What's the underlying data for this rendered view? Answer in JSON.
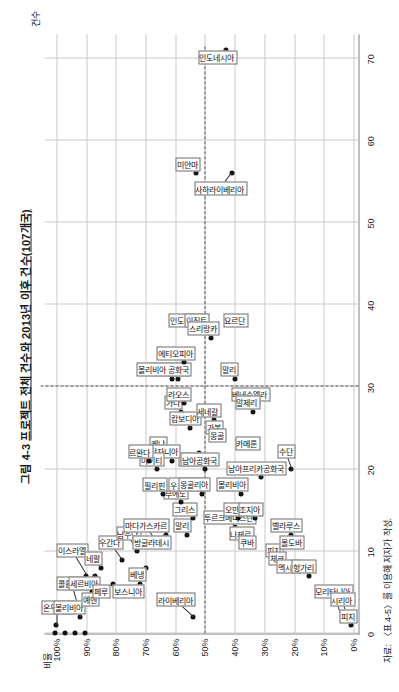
{
  "figure": {
    "title_prefix": "그림 4-3",
    "title_main": "프로젝트 전체 건수와 2013년 이후 건수(107개국)",
    "source_note": "자료: 〈표 4-5〉를 이용해 저자가 작성."
  },
  "axes": {
    "x_title": "건수",
    "y_title": "비율",
    "x_ticks": [
      "0",
      "10",
      "20",
      "30",
      "40",
      "50",
      "60",
      "70"
    ],
    "x_values": [
      0,
      10,
      20,
      30,
      40,
      50,
      60,
      70
    ],
    "x_min": 0,
    "x_max": 73,
    "y_ticks": [
      "0%",
      "10%",
      "20%",
      "30%",
      "40%",
      "50%",
      "60%",
      "70%",
      "80%",
      "90%",
      "100%"
    ],
    "y_values": [
      0,
      10,
      20,
      30,
      40,
      50,
      60,
      70,
      80,
      90,
      100
    ],
    "y_min": -2,
    "y_max": 104,
    "reference_x": 30,
    "reference_y": 50,
    "grid": true
  },
  "chart_data": {
    "type": "scatter",
    "title": "그림 4-3 프로젝트 전체 건수와 2013년 이후 건수(107개국)",
    "xlabel": "건수",
    "ylabel": "비율",
    "xlim": [
      0,
      73
    ],
    "ylim": [
      -2,
      104
    ],
    "grid": true,
    "legend": "none",
    "reference_lines": {
      "vertical_x": 30,
      "horizontal_y": 50
    },
    "points": [
      {
        "label": "온두라스",
        "x": 1,
        "y": 100,
        "lx": 3,
        "ly": 100
      },
      {
        "label": "콜롬비아",
        "x": 2,
        "y": 92,
        "lx": 6,
        "ly": 95
      },
      {
        "label": "볼리비아",
        "x": 4,
        "y": 90,
        "lx": 3,
        "ly": 96
      },
      {
        "label": "이스라엘",
        "x": 7,
        "y": 90,
        "lx": 10,
        "ly": 95
      },
      {
        "label": "세르비아",
        "x": 7,
        "y": 87,
        "lx": 6,
        "ly": 91
      },
      {
        "label": "예멘",
        "x": 5,
        "y": 88,
        "lx": 4,
        "ly": 89
      },
      {
        "label": "네팔",
        "x": 8,
        "y": 85,
        "lx": 9,
        "ly": 88
      },
      {
        "label": "페루",
        "x": 6,
        "y": 81,
        "lx": 5,
        "ly": 85
      },
      {
        "label": "우간다",
        "x": 9,
        "y": 78,
        "lx": 11,
        "ly": 82
      },
      {
        "label": "보스니아",
        "x": 6,
        "y": 72,
        "lx": 5,
        "ly": 76
      },
      {
        "label": "남수단",
        "x": 10,
        "y": 73,
        "lx": 12,
        "ly": 76
      },
      {
        "label": "베냉",
        "x": 8,
        "y": 70,
        "lx": 7,
        "ly": 73
      },
      {
        "label": "마다가스카르",
        "x": 11,
        "y": 66,
        "lx": 13,
        "ly": 70
      },
      {
        "label": "방글라데시",
        "x": 12,
        "y": 63,
        "lx": 11,
        "ly": 68
      },
      {
        "label": "라이베리아",
        "x": 2,
        "y": 54,
        "lx": 4,
        "ly": 60
      },
      {
        "label": "말리",
        "x": 12,
        "y": 56,
        "lx": 13,
        "ly": 58
      },
      {
        "label": "그리스",
        "x": 14,
        "y": 54,
        "lx": 15,
        "ly": 57
      },
      {
        "label": "부에노",
        "x": 16,
        "y": 58,
        "lx": 17,
        "ly": 60
      },
      {
        "label": "우크라이나",
        "x": 18,
        "y": 53,
        "lx": 18,
        "ly": 56
      },
      {
        "label": "몽골리아",
        "x": 17,
        "y": 51,
        "lx": 18,
        "ly": 54
      },
      {
        "label": "베트남",
        "x": 22,
        "y": 52,
        "lx": 21,
        "ly": 55
      },
      {
        "label": "남아공화국",
        "x": 20,
        "y": 50,
        "lx": 21,
        "ly": 52
      },
      {
        "label": "가나",
        "x": 27,
        "y": 58,
        "lx": 28,
        "ly": 61
      },
      {
        "label": "케냐",
        "x": 22,
        "y": 63,
        "lx": 23,
        "ly": 66
      },
      {
        "label": "탄자니아",
        "x": 21,
        "y": 61,
        "lx": 22,
        "ly": 64
      },
      {
        "label": "아이티",
        "x": 20,
        "y": 66,
        "lx": 21,
        "ly": 68
      },
      {
        "label": "르완다",
        "x": 21,
        "y": 69,
        "lx": 22,
        "ly": 72
      },
      {
        "label": "필리핀",
        "x": 17,
        "y": 64,
        "lx": 18,
        "ly": 67
      },
      {
        "label": "캄보디아",
        "x": 25,
        "y": 55,
        "lx": 26,
        "ly": 57
      },
      {
        "label": "라오스",
        "x": 28,
        "y": 57,
        "lx": 29,
        "ly": 59
      },
      {
        "label": "나이지리아",
        "x": 31,
        "y": 59,
        "lx": 32,
        "ly": 62
      },
      {
        "label": "볼리비아 공화국",
        "x": 31,
        "y": 61,
        "lx": 32,
        "ly": 64
      },
      {
        "label": "에티오피아",
        "x": 33,
        "y": 57,
        "lx": 34,
        "ly": 60
      },
      {
        "label": "인도네시아",
        "x": 37,
        "y": 53,
        "lx": 38,
        "ly": 56
      },
      {
        "label": "이집트",
        "x": 38,
        "y": 51,
        "lx": 38,
        "ly": 53
      },
      {
        "label": "스리랑카",
        "x": 36,
        "y": 48,
        "lx": 37,
        "ly": 51
      },
      {
        "label": "미얀마",
        "x": 56,
        "y": 53,
        "lx": 57,
        "ly": 56
      },
      {
        "label": "인도네시아",
        "x": 71,
        "y": 43,
        "lx": 70,
        "ly": 46
      },
      {
        "label": "사하라이베리아",
        "x": 56,
        "y": 41,
        "lx": 54,
        "ly": 45
      },
      {
        "label": "요르단",
        "x": 38,
        "y": 38,
        "lx": 38,
        "ly": 40
      },
      {
        "label": "말리",
        "x": 31,
        "y": 40,
        "lx": 32,
        "ly": 42
      },
      {
        "label": "베네수엘라",
        "x": 28,
        "y": 32,
        "lx": 29,
        "ly": 35
      },
      {
        "label": "알제리",
        "x": 27,
        "y": 34,
        "lx": 28,
        "ly": 36
      },
      {
        "label": "세네갈",
        "x": 26,
        "y": 47,
        "lx": 27,
        "ly": 49
      },
      {
        "label": "가봉",
        "x": 25,
        "y": 45,
        "lx": 25,
        "ly": 47
      },
      {
        "label": "몽골",
        "x": 24,
        "y": 44,
        "lx": 24,
        "ly": 46
      },
      {
        "label": "카메룬",
        "x": 23,
        "y": 33,
        "lx": 23,
        "ly": 36
      },
      {
        "label": "볼리비아",
        "x": 17,
        "y": 38,
        "lx": 18,
        "ly": 41
      },
      {
        "label": "남아프리카공화국",
        "x": 19,
        "y": 31,
        "lx": 20,
        "ly": 33
      },
      {
        "label": "수단",
        "x": 20,
        "y": 21,
        "lx": 22,
        "ly": 23
      },
      {
        "label": "투르크메니스탄",
        "x": 13,
        "y": 40,
        "lx": 14,
        "ly": 42
      },
      {
        "label": "오만",
        "x": 14,
        "y": 39,
        "lx": 15,
        "ly": 41
      },
      {
        "label": "나제르",
        "x": 12,
        "y": 36,
        "lx": 12,
        "ly": 38
      },
      {
        "label": "쿠바",
        "x": 11,
        "y": 34,
        "lx": 11,
        "ly": 36
      },
      {
        "label": "조지아",
        "x": 14,
        "y": 33,
        "lx": 15,
        "ly": 35
      },
      {
        "label": "피지",
        "x": 10,
        "y": 25,
        "lx": 10,
        "ly": 27
      },
      {
        "label": "체코",
        "x": 9,
        "y": 24,
        "lx": 9,
        "ly": 26
      },
      {
        "label": "벨라루스",
        "x": 12,
        "y": 21,
        "lx": 13,
        "ly": 23
      },
      {
        "label": "몰도바",
        "x": 11,
        "y": 19,
        "lx": 11,
        "ly": 21
      },
      {
        "label": "멕시코",
        "x": 8,
        "y": 20,
        "lx": 8,
        "ly": 22
      },
      {
        "label": "헝가리",
        "x": 7,
        "y": 15,
        "lx": 8,
        "ly": 17
      },
      {
        "label": "모리타니아",
        "x": 2,
        "y": 4,
        "lx": 5,
        "ly": 7
      },
      {
        "label": "시리아",
        "x": 2,
        "y": 2,
        "lx": 4,
        "ly": 4
      },
      {
        "label": "피지",
        "x": 1,
        "y": 1,
        "lx": 2,
        "ly": 2
      }
    ]
  }
}
